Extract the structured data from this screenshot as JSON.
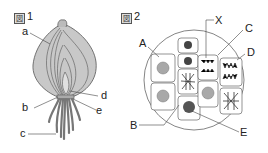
{
  "figure1": {
    "title_prefix": "図",
    "title_number": "1",
    "subject": "onion-bulb",
    "labels": {
      "a": "a",
      "b": "b",
      "c": "c",
      "d": "d",
      "e": "e"
    }
  },
  "figure2": {
    "title_prefix": "図",
    "title_number": "2",
    "subject": "root-tip-cells",
    "labels": {
      "A": "A",
      "B": "B",
      "C": "C",
      "D": "D",
      "E": "E",
      "X": "X"
    }
  },
  "colors": {
    "fill_gray": "#c8c8c8",
    "line": "#555555",
    "nucleus": "#a8a8a8",
    "text": "#222222"
  }
}
